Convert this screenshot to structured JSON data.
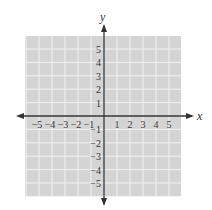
{
  "chart_data": {
    "type": "scatter",
    "title": "",
    "xlabel": "x",
    "ylabel": "y",
    "xlim": [
      -6,
      6
    ],
    "ylim": [
      -6,
      6
    ],
    "grid": true,
    "x_ticks": [
      -5,
      -4,
      -3,
      -2,
      -1,
      1,
      2,
      3,
      4,
      5
    ],
    "y_ticks": [
      5,
      4,
      3,
      2,
      1,
      -1,
      -2,
      -3,
      -4,
      -5
    ],
    "x_tick_labels": [
      "−5",
      "−4",
      "−3",
      "−2",
      "−1",
      "1",
      "2",
      "3",
      "4",
      "5"
    ],
    "y_tick_labels": [
      "5",
      "4",
      "3",
      "2",
      "1",
      "−1",
      "−2",
      "−3",
      "−4",
      "−5"
    ],
    "series": [],
    "colors": {
      "grid_fill": "#d4d4d4",
      "grid_lines": "#f2f2f2",
      "axis": "#333333"
    }
  }
}
